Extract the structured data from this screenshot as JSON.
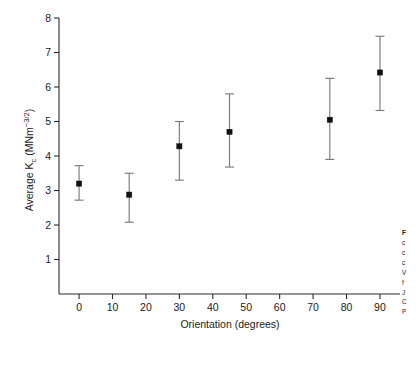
{
  "chart_data": {
    "type": "scatter",
    "title": "",
    "xlabel": "Orientation (degrees)",
    "ylabel": "Average Kc (MNm-3/2)",
    "ylabel_parts": {
      "prefix": "Average K",
      "subscript": "c",
      "middle": " (MNm",
      "superscript": "−3/2",
      "suffix": ")"
    },
    "x": [
      0,
      15,
      30,
      45,
      75,
      90
    ],
    "values": [
      3.2,
      2.88,
      4.28,
      4.7,
      5.05,
      6.42
    ],
    "yerr_lower": [
      0.48,
      0.8,
      0.98,
      1.02,
      1.15,
      1.1
    ],
    "yerr_upper": [
      0.52,
      0.62,
      0.72,
      1.1,
      1.2,
      1.05
    ],
    "points": [
      {
        "x": 0,
        "y": 3.2,
        "low": 2.72,
        "high": 3.72
      },
      {
        "x": 15,
        "y": 2.88,
        "low": 2.08,
        "high": 3.5
      },
      {
        "x": 30,
        "y": 4.28,
        "low": 3.3,
        "high": 5.0
      },
      {
        "x": 45,
        "y": 4.7,
        "low": 3.68,
        "high": 5.8
      },
      {
        "x": 75,
        "y": 5.05,
        "low": 3.9,
        "high": 6.25
      },
      {
        "x": 90,
        "y": 6.42,
        "low": 5.32,
        "high": 7.47
      }
    ],
    "xlim": [
      -6,
      96
    ],
    "ylim": [
      0,
      8
    ],
    "xticks": [
      0,
      10,
      20,
      30,
      40,
      50,
      60,
      70,
      80,
      90
    ],
    "xticklabels": [
      "0",
      "10",
      "20",
      "30",
      "40",
      "50",
      "60",
      "70",
      "80",
      "90"
    ],
    "yticks": [
      1,
      2,
      3,
      4,
      5,
      6,
      7,
      8
    ],
    "yticklabels": [
      "1",
      "2",
      "3",
      "4",
      "5",
      "6",
      "7",
      "8"
    ],
    "grid": false,
    "legend": null,
    "marker_color": "#111111",
    "errorbar_color": "#7a7a7a",
    "axis_color": "#2a2a2a"
  },
  "caption": {
    "head": "F",
    "lines": [
      "c",
      "c",
      "c",
      "V",
      "f",
      "J",
      "C",
      "P"
    ]
  }
}
